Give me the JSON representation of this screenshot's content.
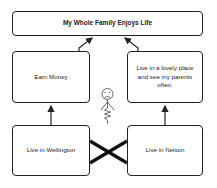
{
  "diagram": {
    "goal": {
      "label": "My Whole Family Enjoys Life"
    },
    "left_middle": {
      "label": "Earn Money"
    },
    "right_middle": {
      "label": "Live in a lovely place and see my parents often."
    },
    "left_bottom": {
      "label": "Live in Wellington"
    },
    "right_bottom": {
      "label": "Live in Nelson"
    },
    "figure": {
      "icon": "sad-stick-figure",
      "expression": "frowning",
      "body": "zigzag-spring"
    },
    "conflict": {
      "icon": "x-cross",
      "between": [
        "Live in Wellington",
        "Live in Nelson"
      ]
    },
    "arrows": [
      {
        "from": "Earn Money",
        "to": "My Whole Family Enjoys Life"
      },
      {
        "from": "Live in a lovely place and see my parents often.",
        "to": "My Whole Family Enjoys Life"
      },
      {
        "from": "Live in Wellington",
        "to": "Earn Money"
      },
      {
        "from": "Live in Nelson",
        "to": "Live in a lovely place and see my parents often."
      }
    ],
    "colors": {
      "stroke": "#222222",
      "background": "#ffffff"
    }
  }
}
